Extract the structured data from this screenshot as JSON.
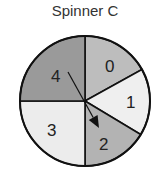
{
  "title": "Spinner C",
  "spinner": {
    "center": [
      85,
      101
    ],
    "radius": 65,
    "sections": [
      {
        "label": "0",
        "fill": "#bdbdbd",
        "start_deg": -90,
        "end_deg": -29,
        "label_pos": [
          105,
          72
        ]
      },
      {
        "label": "1",
        "fill": "#efefef",
        "start_deg": -29,
        "end_deg": 31,
        "label_pos": [
          126,
          108
        ]
      },
      {
        "label": "2",
        "fill": "#b3b3b3",
        "start_deg": 31,
        "end_deg": 90,
        "label_pos": [
          99,
          150
        ]
      },
      {
        "label": "3",
        "fill": "#ececec",
        "start_deg": 90,
        "end_deg": 180,
        "label_pos": [
          47,
          136
        ]
      },
      {
        "label": "4",
        "fill": "#9a9a9a",
        "start_deg": 180,
        "end_deg": 270,
        "label_pos": [
          51,
          82
        ]
      }
    ],
    "arrow": {
      "from": [
        68,
        72
      ],
      "to": [
        99,
        128
      ],
      "color": "#111111"
    }
  }
}
